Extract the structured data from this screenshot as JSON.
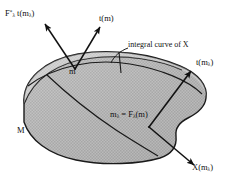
{
  "figure": {
    "domain": "diagram",
    "kind": "differential-geometry-manifold-diagram",
    "width": 228,
    "height": 184,
    "background_color": "#ffffff",
    "ink_color": "#111111",
    "surface_fill_color": "#b8b8b8",
    "surface_outline_color": "#1a1a1a"
  },
  "labels": {
    "pushforward_tangent": {
      "base": "F",
      "sup": "*",
      "sub": "λ",
      "body": "t(m",
      "body_sub": "λ",
      "body_tail": ")"
    },
    "tangent_at_m": "t(m)",
    "integral_curve": "integral curve of  X",
    "tangent_at_mlambda": {
      "head": "t(m",
      "sub": "λ",
      "tail": ")"
    },
    "point_m": "m",
    "image_point": {
      "head": "m",
      "sub1": "λ",
      "mid": " = F",
      "sub2": "λ",
      "tail": "(m)"
    },
    "manifold": "M",
    "vector_field_at_mlambda": {
      "head": "X(m",
      "sub": "λ",
      "tail": ")"
    }
  },
  "geometry": {
    "surface_path": "M 24 104 C 22 80 44 60 78 54 C 112 48 152 54 180 66 C 199 74 208 86 206 98 C 205 108 196 114 188 118 C 180 122 175 128 176 136 C 177 146 172 154 160 158 C 140 164 104 166 76 160 C 48 154 30 140 24 122 Z",
    "top_edge_path": "M 24 104 C 34 78 58 62 92 58 C 126 54 160 60 182 70",
    "ridge_path": "M 30 86 C 52 68 92 60 128 64 C 158 67 186 78 199 92",
    "integral_curve_main": "M 50 77 C 72 93 96 112 120 128 C 134 137 146 144 156 149",
    "integral_curve_upper": "M 52 72 C 78 88 104 108 128 124 C 142 133 153 141 162 147",
    "curve_leader": "M 127 47 C 118 50 112 56 109 62",
    "arrow_tm_shaft": "M 74 68 L 101 25",
    "arrow_fstar_shaft": "M 74 68 L 44 22",
    "arrow_tmlam_shaft": "M 150 128 L 192 70",
    "arrow_xmlam_shaft": "M 150 128 L 196 166",
    "curve_marker_tick": "M 118 52 L 120 72"
  }
}
